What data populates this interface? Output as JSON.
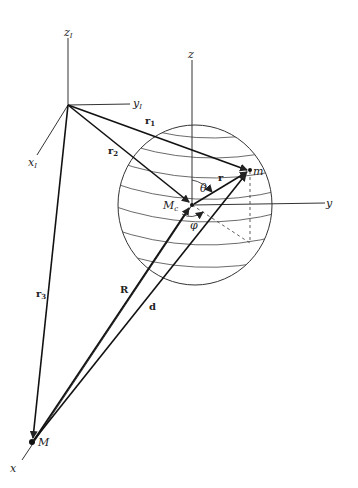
{
  "figure": {
    "inertial_frame": {
      "axes": [
        "z_I",
        "y_I",
        "x_I"
      ],
      "labels": {
        "z": "z",
        "y": "y",
        "x": "x",
        "sub": "I"
      }
    },
    "body_frame": {
      "labels": {
        "z": "z",
        "y": "y",
        "x": "x"
      }
    },
    "points": {
      "center_mass": {
        "label": "M",
        "sub": "c"
      },
      "small_mass": "m",
      "external_mass": "M"
    },
    "vectors": {
      "r1": {
        "label": "r",
        "sub": "1"
      },
      "r2": {
        "label": "r",
        "sub": "2"
      },
      "r3": {
        "label": "r",
        "sub": "3"
      },
      "r": "r",
      "R": "R",
      "d": "d"
    },
    "angles": {
      "polar": "θ",
      "azimuth": "φ"
    },
    "colors": {
      "ink": "#222222",
      "background": "#ffffff"
    }
  }
}
